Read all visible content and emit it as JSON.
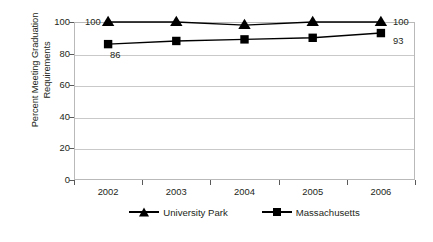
{
  "chart_data": {
    "type": "line",
    "title": "",
    "xlabel": "",
    "ylabel": "Percent Meeting Graduation Requirements",
    "ylabel_lines": [
      "Percent Meeting Graduation",
      "Requirements"
    ],
    "categories": [
      "2002",
      "2003",
      "2004",
      "2005",
      "2006"
    ],
    "ylim": [
      0,
      100
    ],
    "yticks": [
      0,
      20,
      40,
      60,
      80,
      100
    ],
    "ytick_labels": [
      "0",
      "20",
      "40",
      "60",
      "80",
      "100"
    ],
    "grid": true,
    "legend_position": "bottom",
    "series": [
      {
        "name": "University Park",
        "marker": "triangle",
        "color": "#000000",
        "values": [
          100,
          100,
          98,
          100,
          100
        ]
      },
      {
        "name": "Massachusetts",
        "marker": "square",
        "color": "#000000",
        "values": [
          86,
          88,
          89,
          90,
          93
        ]
      }
    ],
    "annotations": [
      {
        "text": "100",
        "series": "University Park",
        "category": "2002",
        "value": 100,
        "position": "left"
      },
      {
        "text": "86",
        "series": "Massachusetts",
        "category": "2002",
        "value": 86,
        "position": "below-right"
      },
      {
        "text": "100",
        "series": "University Park",
        "category": "2006",
        "value": 100,
        "position": "right"
      },
      {
        "text": "93",
        "series": "Massachusetts",
        "category": "2006",
        "value": 93,
        "position": "right"
      }
    ]
  },
  "legend": {
    "entries": [
      {
        "label": "University Park",
        "marker": "triangle"
      },
      {
        "label": "Massachusetts",
        "marker": "square"
      }
    ]
  }
}
